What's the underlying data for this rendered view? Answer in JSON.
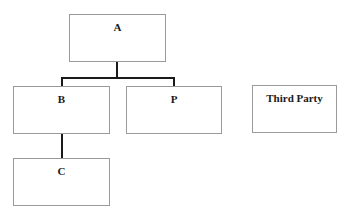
{
  "diagram": {
    "type": "org-chart",
    "nodes": [
      {
        "id": "A",
        "label": "A"
      },
      {
        "id": "B",
        "label": "B"
      },
      {
        "id": "P",
        "label": "P"
      },
      {
        "id": "C",
        "label": "C"
      },
      {
        "id": "third-party",
        "label": "Third Party"
      }
    ],
    "edges": [
      {
        "from": "A",
        "to": "B"
      },
      {
        "from": "A",
        "to": "P"
      },
      {
        "from": "B",
        "to": "C"
      }
    ]
  },
  "colors": {
    "box_border": "#9a9a9a",
    "connector": "#1a1a1a",
    "text": "#1a1a1a",
    "background": "#ffffff"
  }
}
